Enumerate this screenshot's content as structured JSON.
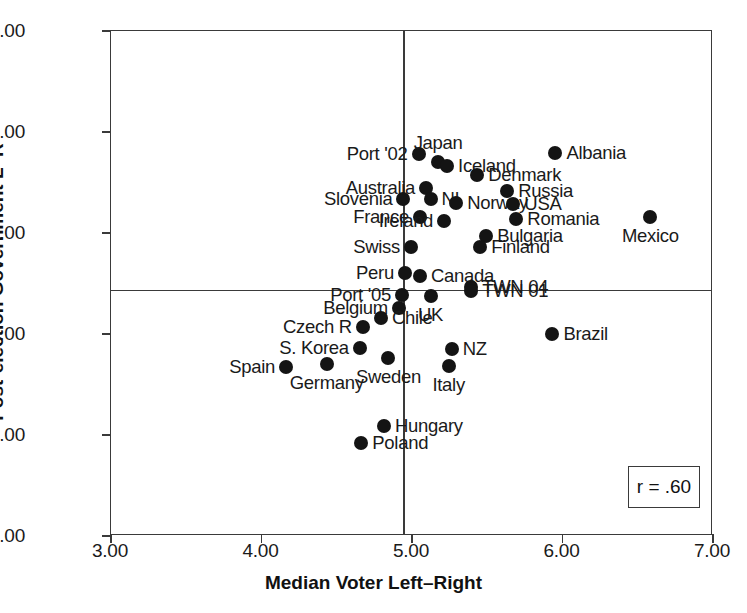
{
  "chart_data": {
    "type": "scatter",
    "title": "",
    "xlabel": "Median Voter Left–Right",
    "ylabel": "Post-election Government L–R",
    "xlim": [
      3.0,
      7.0
    ],
    "ylim": [
      0.0,
      10.0
    ],
    "xticks": [
      "3.00",
      "4.00",
      "5.00",
      "6.00",
      "7.00"
    ],
    "xtick_values": [
      3.0,
      4.0,
      5.0,
      6.0,
      7.0
    ],
    "yticks": [
      "0.00",
      "2.00",
      "4.00",
      "6.00",
      "8.00",
      "10.00"
    ],
    "ytick_values": [
      0.0,
      2.0,
      4.0,
      6.0,
      8.0,
      10.0
    ],
    "grid": false,
    "legend": null,
    "reference_lines": {
      "vertical_x": 4.94,
      "horizontal_y": 4.88
    },
    "annotation": {
      "text": "r = .60",
      "correlation": 0.6
    },
    "points": [
      {
        "label": "Port '02",
        "x": 5.05,
        "y": 7.55,
        "pos": "left"
      },
      {
        "label": "Japan",
        "x": 5.18,
        "y": 7.38,
        "pos": "above"
      },
      {
        "label": "Iceland",
        "x": 5.24,
        "y": 7.3,
        "pos": "right"
      },
      {
        "label": "Albania",
        "x": 5.96,
        "y": 7.57,
        "pos": "right"
      },
      {
        "label": "Denmark",
        "x": 5.44,
        "y": 7.12,
        "pos": "right"
      },
      {
        "label": "Australia",
        "x": 5.1,
        "y": 6.88,
        "pos": "left"
      },
      {
        "label": "Russia",
        "x": 5.64,
        "y": 6.82,
        "pos": "right"
      },
      {
        "label": "Slovenia",
        "x": 4.95,
        "y": 6.65,
        "pos": "left"
      },
      {
        "label": "NI",
        "x": 5.13,
        "y": 6.66,
        "pos": "right"
      },
      {
        "label": "Norway",
        "x": 5.3,
        "y": 6.58,
        "pos": "right"
      },
      {
        "label": "USA",
        "x": 5.68,
        "y": 6.55,
        "pos": "right"
      },
      {
        "label": "France",
        "x": 5.06,
        "y": 6.3,
        "pos": "left"
      },
      {
        "label": "Ireland",
        "x": 5.22,
        "y": 6.22,
        "pos": "left"
      },
      {
        "label": "Romania",
        "x": 5.7,
        "y": 6.26,
        "pos": "right"
      },
      {
        "label": "Mexico",
        "x": 6.59,
        "y": 6.3,
        "pos": "below"
      },
      {
        "label": "Bulgaria",
        "x": 5.5,
        "y": 5.93,
        "pos": "right"
      },
      {
        "label": "Swiss",
        "x": 5.0,
        "y": 5.7,
        "pos": "left"
      },
      {
        "label": "Finland",
        "x": 5.46,
        "y": 5.7,
        "pos": "right"
      },
      {
        "label": "Peru",
        "x": 4.96,
        "y": 5.18,
        "pos": "left"
      },
      {
        "label": "Canada",
        "x": 5.06,
        "y": 5.12,
        "pos": "right"
      },
      {
        "label": "TWN 04",
        "x": 5.4,
        "y": 4.92,
        "pos": "right"
      },
      {
        "label": "TWN 01",
        "x": 5.4,
        "y": 4.84,
        "pos": "right"
      },
      {
        "label": "Port '05",
        "x": 4.94,
        "y": 4.76,
        "pos": "left"
      },
      {
        "label": "UK",
        "x": 5.13,
        "y": 4.74,
        "pos": "below"
      },
      {
        "label": "Belgium",
        "x": 4.92,
        "y": 4.5,
        "pos": "left"
      },
      {
        "label": "Chile",
        "x": 4.8,
        "y": 4.3,
        "pos": "right"
      },
      {
        "label": "Czech R",
        "x": 4.68,
        "y": 4.12,
        "pos": "left"
      },
      {
        "label": "Brazil",
        "x": 5.94,
        "y": 3.98,
        "pos": "right"
      },
      {
        "label": "S. Korea",
        "x": 4.66,
        "y": 3.7,
        "pos": "left"
      },
      {
        "label": "NZ",
        "x": 5.27,
        "y": 3.68,
        "pos": "right"
      },
      {
        "label": "Sweden",
        "x": 4.85,
        "y": 3.5,
        "pos": "below"
      },
      {
        "label": "Germany",
        "x": 4.44,
        "y": 3.38,
        "pos": "below"
      },
      {
        "label": "Spain",
        "x": 4.17,
        "y": 3.32,
        "pos": "left"
      },
      {
        "label": "Italy",
        "x": 5.25,
        "y": 3.34,
        "pos": "below"
      },
      {
        "label": "Hungary",
        "x": 4.82,
        "y": 2.15,
        "pos": "right"
      },
      {
        "label": "Poland",
        "x": 4.67,
        "y": 1.82,
        "pos": "right"
      }
    ]
  },
  "layout": {
    "plot_left": 110,
    "plot_top": 30,
    "plot_width": 602,
    "plot_height": 505
  }
}
